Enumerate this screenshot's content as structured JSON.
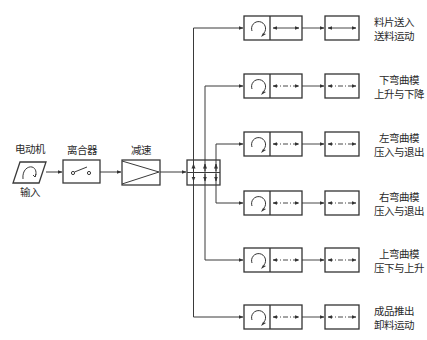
{
  "diagram": {
    "colors": {
      "line": "#3a3a3a",
      "box": "#333333",
      "background": "#ffffff"
    },
    "input_chain": [
      {
        "id": "motor",
        "label": "电动机",
        "sublabel": "输入",
        "icon": "motor-rotation-icon"
      },
      {
        "id": "clutch",
        "label": "离合器",
        "icon": "switch-icon"
      },
      {
        "id": "reducer",
        "label": "减速",
        "icon": "amplifier-triangle-icon"
      },
      {
        "id": "distributor",
        "label": "",
        "icon": "arrow-grid-icon"
      }
    ],
    "outputs": [
      {
        "line1": "料片送入",
        "line2": "送料运动",
        "link_style": "solid"
      },
      {
        "line1": "下弯曲模",
        "line2": "上升与下降",
        "link_style": "dashdot"
      },
      {
        "line1": "左弯曲模",
        "line2": "压入与退出",
        "link_style": "dashdot"
      },
      {
        "line1": "右弯曲模",
        "line2": "压入与退出",
        "link_style": "dashdot"
      },
      {
        "line1": "上弯曲模",
        "line2": "压下与上升",
        "link_style": "dashdot"
      },
      {
        "line1": "成品推出",
        "line2": "卸料运动",
        "link_style": "dashdot"
      }
    ]
  }
}
